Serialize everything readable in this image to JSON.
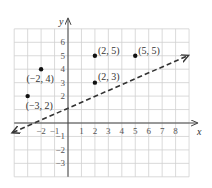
{
  "chart_data": {
    "type": "scatter",
    "title": "",
    "xlabel": "x",
    "ylabel": "y",
    "xlim": [
      -4,
      9
    ],
    "ylim": [
      -4,
      7
    ],
    "grid": true,
    "x_ticks": [
      "-2",
      "-1",
      "1",
      "2",
      "3",
      "4",
      "5",
      "6",
      "7",
      "8"
    ],
    "y_ticks": [
      "6",
      "5",
      "4",
      "3",
      "2",
      "-1",
      "-2",
      "-3"
    ],
    "points": [
      {
        "x": -3,
        "y": 2,
        "label": "(−3, 2)"
      },
      {
        "x": -2,
        "y": 4,
        "label": "(−2, 4)"
      },
      {
        "x": 2,
        "y": 3,
        "label": "(2, 3)"
      },
      {
        "x": 2,
        "y": 5,
        "label": "(2, 5)"
      },
      {
        "x": 5,
        "y": 5,
        "label": "(5, 5)"
      }
    ],
    "line": {
      "style": "dashed",
      "from": [
        -4.1,
        -0.7
      ],
      "to": [
        8.9,
        5
      ]
    },
    "colors": {
      "grid": "#d0d0d0",
      "axis": "#444444",
      "point": "#111111",
      "line": "#333333"
    }
  },
  "axes": {
    "x_label": "x",
    "y_label": "y"
  }
}
